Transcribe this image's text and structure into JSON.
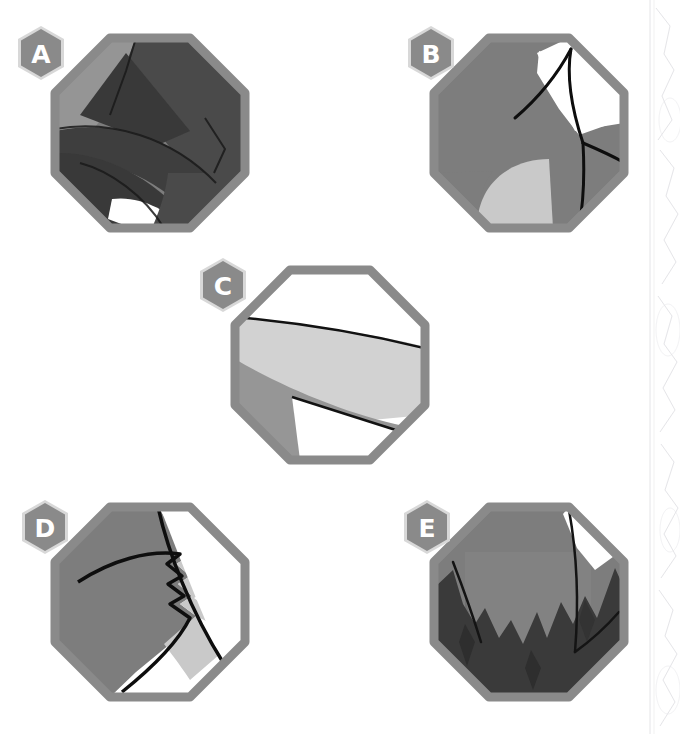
{
  "page": {
    "background_color": "#ffffff",
    "width": 680,
    "height": 734
  },
  "palette": {
    "tile_border": "#8a8a8a",
    "tile_border_shadow": "#c9c9c9",
    "mid_gray": "#7d7d7d",
    "dark_gray": "#3a3a3a",
    "darker_gray": "#2e2e2e",
    "light_gray": "#d2d2d2",
    "lighter_gray": "#bdbdbd",
    "white": "#ffffff",
    "outline": "#111111",
    "badge_fill": "#8a8a8a",
    "badge_halo": "#d8d8d8",
    "badge_letter": "#ffffff",
    "edge_texture": "#c4c4cc"
  },
  "tiles": [
    {
      "id": "a",
      "label": "A",
      "badge_label": "A",
      "shape": "octagon",
      "center": {
        "x": 150,
        "y": 133
      },
      "radius": 95,
      "badge": {
        "x": 14,
        "y": 24
      },
      "description": "octagon tile with dark angular bands and a white wedge at lower left",
      "region_count": 7
    },
    {
      "id": "b",
      "label": "B",
      "badge_label": "B",
      "shape": "octagon",
      "center": {
        "x": 529,
        "y": 133
      },
      "radius": 95,
      "badge": {
        "x": 404,
        "y": 24
      },
      "description": "octagon tile, mid gray field with white upper-right panel and light gray fan at the bottom",
      "region_count": 4
    },
    {
      "id": "c",
      "label": "C",
      "badge_label": "C",
      "shape": "octagon",
      "center": {
        "x": 330,
        "y": 365
      },
      "radius": 95,
      "badge": {
        "x": 196,
        "y": 256
      },
      "description": "octagon tile with a wide light gray band, mid gray lower-left wedge and a white triangle at the bottom",
      "region_count": 4
    },
    {
      "id": "d",
      "label": "D",
      "badge_label": "D",
      "shape": "octagon",
      "center": {
        "x": 150,
        "y": 602
      },
      "radius": 95,
      "badge": {
        "x": 18,
        "y": 498
      },
      "description": "octagon tile, mid gray body with a zig-zag torn edge, thin light gray sliver and white right panel",
      "region_count": 4
    },
    {
      "id": "e",
      "label": "E",
      "badge_label": "E",
      "shape": "octagon",
      "center": {
        "x": 529,
        "y": 602
      },
      "radius": 95,
      "badge": {
        "x": 400,
        "y": 498
      },
      "description": "octagon tile, mid gray dome over a dark jagged mountain silhouette with a small white sliver top right",
      "region_count": 5
    }
  ],
  "legend": {
    "tile_labels": [
      "A",
      "B",
      "C",
      "D",
      "E"
    ],
    "tile_count": 5
  }
}
